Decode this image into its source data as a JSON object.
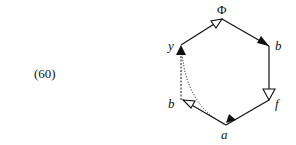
{
  "equation_number": "(60)",
  "diagram": {
    "type": "hexagon-arrow-diagram",
    "vertices": [
      {
        "id": "top",
        "label": "Φ"
      },
      {
        "id": "top_right",
        "label": "b"
      },
      {
        "id": "bottom_right",
        "label": "f"
      },
      {
        "id": "bottom",
        "label": "a"
      },
      {
        "id": "bottom_left",
        "label": "b"
      },
      {
        "id": "top_left",
        "label": "y"
      }
    ],
    "edges": [
      {
        "from": "top_left",
        "to": "top",
        "style": "solid",
        "arrowhead": "open"
      },
      {
        "from": "top",
        "to": "top_right",
        "style": "solid",
        "arrowhead": "filled"
      },
      {
        "from": "top_right",
        "to": "bottom_right",
        "style": "solid",
        "arrowhead": "open"
      },
      {
        "from": "bottom_right",
        "to": "bottom",
        "style": "solid",
        "arrowhead": "filled"
      },
      {
        "from": "bottom",
        "to": "bottom_left",
        "style": "solid",
        "arrowhead": "open"
      },
      {
        "from": "bottom_left",
        "to": "top_left",
        "style": "dashed",
        "arrowhead": "filled"
      },
      {
        "from": "bottom",
        "to": "top_left",
        "style": "dotted-curve",
        "arrowhead": "filled"
      }
    ]
  },
  "colors": {
    "stroke": "#111111",
    "background": "#ffffff"
  }
}
